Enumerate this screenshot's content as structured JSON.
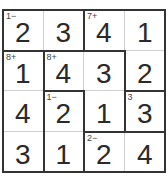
{
  "puzzle": {
    "size": 4,
    "values": [
      [
        2,
        3,
        4,
        1
      ],
      [
        1,
        4,
        3,
        2
      ],
      [
        4,
        2,
        1,
        3
      ],
      [
        3,
        1,
        2,
        4
      ]
    ],
    "cages": [
      {
        "clue": "1−",
        "cells": [
          [
            0,
            0
          ],
          [
            0,
            1
          ]
        ]
      },
      {
        "clue": "7+",
        "cells": [
          [
            0,
            2
          ],
          [
            0,
            3
          ],
          [
            1,
            3
          ]
        ]
      },
      {
        "clue": "8+",
        "cells": [
          [
            1,
            0
          ],
          [
            2,
            0
          ],
          [
            3,
            0
          ]
        ]
      },
      {
        "clue": "8+",
        "cells": [
          [
            1,
            1
          ],
          [
            1,
            2
          ],
          [
            2,
            2
          ]
        ]
      },
      {
        "clue": "1−",
        "cells": [
          [
            2,
            1
          ],
          [
            3,
            1
          ]
        ]
      },
      {
        "clue": "3",
        "cells": [
          [
            2,
            3
          ]
        ]
      },
      {
        "clue": "2−",
        "cells": [
          [
            3,
            2
          ],
          [
            3,
            3
          ]
        ]
      }
    ]
  }
}
